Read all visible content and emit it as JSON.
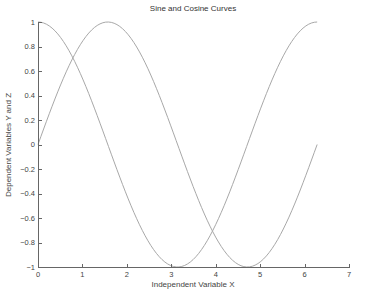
{
  "chart_data": {
    "type": "line",
    "title": "Sine and Cosine Curves",
    "xlabel": "Independent Variable X",
    "ylabel": "Dependent Variables Y and Z",
    "xlim": [
      0,
      7
    ],
    "ylim": [
      -1,
      1
    ],
    "xticks": [
      0,
      1,
      2,
      3,
      4,
      5,
      6,
      7
    ],
    "yticks": [
      -1,
      -0.8,
      -0.6,
      -0.4,
      -0.2,
      0,
      0.2,
      0.4,
      0.6,
      0.8,
      1
    ],
    "xtick_labels": [
      "0",
      "1",
      "2",
      "3",
      "4",
      "5",
      "6",
      "7"
    ],
    "ytick_labels": [
      "−1",
      "−0.8",
      "−0.6",
      "−0.4",
      "−0.2",
      "0",
      "0.2",
      "0.4",
      "0.6",
      "0.8",
      "1"
    ],
    "grid": false,
    "legend": null,
    "series": [
      {
        "name": "sin(x)",
        "color": "#a8a8a8",
        "function": "sin",
        "x": [
          0,
          0.5,
          1.0,
          1.5708,
          2.0,
          2.5,
          3.1416,
          3.5,
          4.0,
          4.7124,
          5.0,
          5.5,
          6.2832
        ],
        "values": [
          0,
          0.479,
          0.841,
          1.0,
          0.909,
          0.598,
          0,
          -0.351,
          -0.757,
          -1.0,
          -0.959,
          -0.706,
          0
        ]
      },
      {
        "name": "cos(x)",
        "color": "#a8a8a8",
        "function": "cos",
        "x": [
          0,
          0.5,
          1.0,
          1.5708,
          2.0,
          2.5,
          3.1416,
          3.5,
          4.0,
          4.7124,
          5.0,
          5.5,
          6.2832
        ],
        "values": [
          1.0,
          0.878,
          0.54,
          0,
          -0.416,
          -0.801,
          -1.0,
          -0.936,
          -0.654,
          0,
          0.284,
          0.709,
          1.0
        ]
      }
    ],
    "x_range_plotted": [
      0,
      6.2832
    ],
    "sample_count": 100
  },
  "layout": {
    "plot_left": 38,
    "plot_right": 349,
    "plot_top": 22,
    "plot_bottom": 267,
    "axis_color": "#666666"
  }
}
